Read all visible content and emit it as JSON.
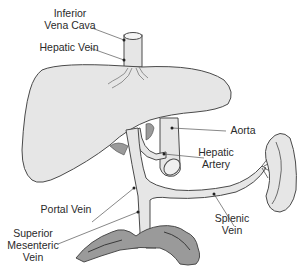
{
  "diagram": {
    "type": "anatomical",
    "colors": {
      "organ_fill": "#e6e6e6",
      "intestine_fill": "#9a9a9a",
      "outline": "#4a4a4a",
      "leader_line": "#555555",
      "text": "#2a2a2a",
      "background": "#ffffff"
    },
    "labels": {
      "ivc": {
        "line1": "Inferior",
        "line2": "Vena Cava"
      },
      "hepatic_vein": {
        "line1": "Hepatic Vein"
      },
      "aorta": {
        "line1": "Aorta"
      },
      "hepatic_artery": {
        "line1": "Hepatic",
        "line2": "Artery"
      },
      "portal_vein": {
        "line1": "Portal Vein"
      },
      "splenic_vein": {
        "line1": "Splenic",
        "line2": "Vein"
      },
      "smv": {
        "line1": "Superior",
        "line2": "Mesenteric",
        "line3": "Vein"
      }
    },
    "structures": [
      "Liver",
      "Inferior Vena Cava",
      "Hepatic Vein",
      "Aorta",
      "Hepatic Artery",
      "Portal Vein",
      "Splenic Vein",
      "Superior Mesenteric Vein",
      "Spleen",
      "Intestine"
    ]
  }
}
